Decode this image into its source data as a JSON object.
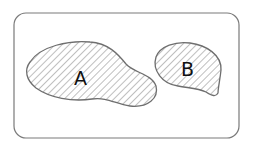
{
  "diagram": {
    "type": "venn-disjoint-sets",
    "universe": {
      "label": "",
      "stroke": "#7a7a7a"
    },
    "sets": [
      {
        "id": "A",
        "label": "A",
        "hatched": true
      },
      {
        "id": "B",
        "label": "B",
        "hatched": true
      }
    ],
    "colors": {
      "outline": "#6e6e6e",
      "hatch": "#8a8a8a",
      "background": "#ffffff",
      "text": "#111111"
    }
  }
}
